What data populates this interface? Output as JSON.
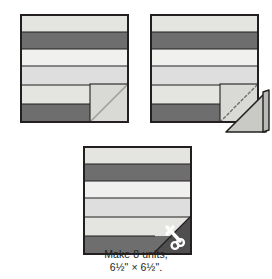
{
  "figure": {
    "type": "quilting-assembly-diagram",
    "caption": {
      "line1": "Make 8 units,",
      "line2": "6½\" × 6½\"."
    },
    "palette": {
      "outline": "#231f20",
      "strip_light": "#e9e9e7",
      "strip_lightest": "#f0f0ee",
      "strip_medium": "#d6d6d3",
      "strip_dark": "#6e6e6e",
      "corner_square": "#d9d9d6",
      "corner_triangle_dark": "#4f4f4f",
      "fold_flap": "#c9c9c6",
      "background": "#ffffff",
      "scissors": "#ffffff",
      "stitch_line": "#8a8a8a"
    },
    "blocks": [
      {
        "id": "block-1",
        "name": "block-before-stitching",
        "x": 20,
        "y": 14,
        "size": 107,
        "strips": [
          {
            "name": "strip-1",
            "height": 17,
            "color": "#e4e4e1"
          },
          {
            "name": "strip-2",
            "height": 17,
            "color": "#6e6e6e"
          },
          {
            "name": "strip-3",
            "height": 17,
            "color": "#f0f0ee"
          },
          {
            "name": "strip-4",
            "height": 19,
            "color": "#dedede"
          },
          {
            "name": "strip-5",
            "height": 19,
            "color": "#e4e4e1"
          },
          {
            "name": "strip-6",
            "height": 18,
            "color": "#6e6e6e"
          }
        ],
        "corner": {
          "name": "corner-square",
          "size": 38,
          "fill": "#d9d9d6",
          "diagonal_line": true,
          "stitched": false,
          "flap": false,
          "scissors": false
        }
      },
      {
        "id": "block-2",
        "name": "block-stitched-and-folded",
        "x": 150,
        "y": 14,
        "size": 107,
        "strips": [
          {
            "name": "strip-1",
            "height": 17,
            "color": "#e4e4e1"
          },
          {
            "name": "strip-2",
            "height": 17,
            "color": "#6e6e6e"
          },
          {
            "name": "strip-3",
            "height": 17,
            "color": "#f0f0ee"
          },
          {
            "name": "strip-4",
            "height": 19,
            "color": "#dedede"
          },
          {
            "name": "strip-5",
            "height": 19,
            "color": "#e4e4e1"
          },
          {
            "name": "strip-6",
            "height": 18,
            "color": "#6e6e6e"
          }
        ],
        "corner": {
          "name": "corner-square",
          "size": 38,
          "fill": "#d9d9d6",
          "diagonal_line": false,
          "stitched": true,
          "flap": true,
          "scissors": false
        }
      },
      {
        "id": "block-3",
        "name": "block-trimmed-finished",
        "x": 83,
        "y": 146,
        "size": 107,
        "strips": [
          {
            "name": "strip-1",
            "height": 17,
            "color": "#e4e4e1"
          },
          {
            "name": "strip-2",
            "height": 17,
            "color": "#6e6e6e"
          },
          {
            "name": "strip-3",
            "height": 17,
            "color": "#f0f0ee"
          },
          {
            "name": "strip-4",
            "height": 19,
            "color": "#dedede"
          },
          {
            "name": "strip-5",
            "height": 19,
            "color": "#e4e4e1"
          },
          {
            "name": "strip-6",
            "height": 18,
            "color": "#6e6e6e"
          }
        ],
        "corner": {
          "name": "corner-triangle",
          "size": 38,
          "fill": "#4f4f4f",
          "diagonal_line": false,
          "stitched": false,
          "flap": false,
          "scissors": true
        }
      }
    ]
  }
}
